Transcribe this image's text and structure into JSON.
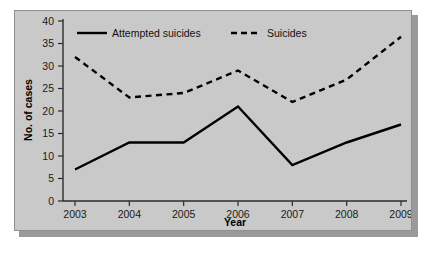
{
  "chart_data": {
    "type": "line",
    "title": "",
    "xlabel": "Year",
    "ylabel": "No. of cases",
    "categories": [
      "2003",
      "2004",
      "2005",
      "2006",
      "2007",
      "2008",
      "2009"
    ],
    "x": [
      2003,
      2004,
      2005,
      2006,
      2007,
      2008,
      2009
    ],
    "series": [
      {
        "name": "Attempted suicides",
        "style": "solid",
        "color": "#000000",
        "values": [
          7,
          13,
          13,
          21,
          8,
          13,
          17
        ]
      },
      {
        "name": "Suicides",
        "style": "dashed",
        "color": "#000000",
        "values": [
          32,
          23,
          24,
          29,
          22,
          27,
          36.5
        ]
      }
    ],
    "ylim": [
      0,
      40
    ],
    "yticks": [
      0,
      5,
      10,
      15,
      20,
      25,
      30,
      35,
      40
    ],
    "ytick_labels": [
      "0",
      "5",
      "10",
      "15",
      "20",
      "25",
      "30",
      "35",
      "40"
    ],
    "xtick_labels": [
      "2003",
      "2004",
      "2005",
      "2006",
      "2007",
      "2008",
      "2009"
    ],
    "grid": false,
    "legend_position": "top-left-inside",
    "background_color": "#c9c9c9",
    "axis_color": "#2b2b2b"
  },
  "legend": {
    "entries": [
      {
        "label": "Attempted suicides",
        "style": "solid"
      },
      {
        "label": "Suicides",
        "style": "dashed"
      }
    ]
  },
  "axes": {
    "y_title": "No. of cases",
    "x_title": "Year"
  }
}
